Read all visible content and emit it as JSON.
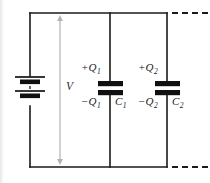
{
  "figure": {
    "type": "circuit-diagram",
    "background_color": "#ffffff",
    "wire_color": "#1a1a1a",
    "plate_color": "#101010",
    "arrow_color": "#b0b0b0"
  },
  "source": {
    "label": "V",
    "description": "battery / voltage source",
    "symbol": "battery-cell"
  },
  "branches": [
    {
      "id": "branch-1",
      "component": "capacitor",
      "top_charge": "+Q",
      "top_charge_sub": "1",
      "bottom_charge": "−Q",
      "bottom_charge_sub": "1",
      "capacitance": "C",
      "capacitance_sub": "1"
    },
    {
      "id": "branch-2",
      "component": "capacitor",
      "top_charge": "+Q",
      "top_charge_sub": "2",
      "bottom_charge": "−Q",
      "bottom_charge_sub": "2",
      "capacitance": "C",
      "capacitance_sub": "2"
    }
  ],
  "continuation": {
    "top_dashes": "- - - -",
    "bottom_dashes": "- - - -",
    "meaning": "circuit continues with more parallel capacitors"
  }
}
